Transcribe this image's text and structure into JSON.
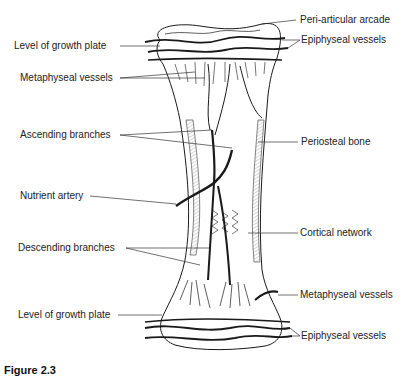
{
  "figure": {
    "caption_visible": "Figure 2.3"
  },
  "labels": {
    "left": [
      {
        "id": "level-growth-plate-top",
        "text": "Level of growth plate"
      },
      {
        "id": "metaphyseal-vessels-top",
        "text": "Metaphyseal vessels"
      },
      {
        "id": "ascending-branches",
        "text": "Ascending branches"
      },
      {
        "id": "nutrient-artery",
        "text": "Nutrient artery"
      },
      {
        "id": "descending-branches",
        "text": "Descending branches"
      },
      {
        "id": "level-growth-plate-bottom",
        "text": "Level of growth plate"
      }
    ],
    "right": [
      {
        "id": "peri-articular-arcade",
        "text": "Peri-articular arcade"
      },
      {
        "id": "epiphyseal-vessels-top",
        "text": "Epiphyseal vessels"
      },
      {
        "id": "periosteal-bone",
        "text": "Periosteal bone"
      },
      {
        "id": "cortical-network",
        "text": "Cortical network"
      },
      {
        "id": "metaphyseal-vessels-bottom",
        "text": "Metaphyseal vessels"
      },
      {
        "id": "epiphyseal-vessels-bottom",
        "text": "Epiphyseal vessels"
      }
    ]
  },
  "colors": {
    "ink": "#1a1a1a",
    "background": "#ffffff"
  }
}
